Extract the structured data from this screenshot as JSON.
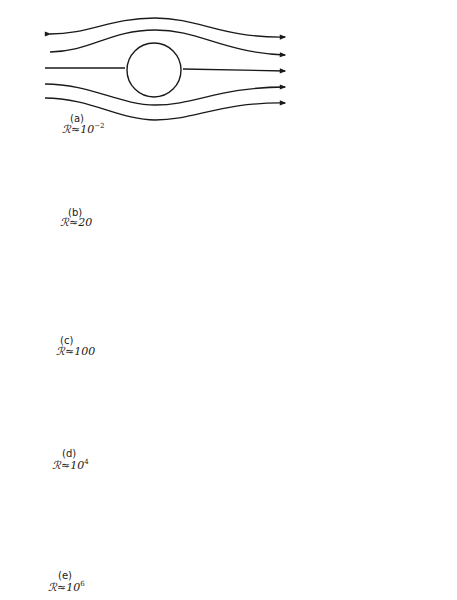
{
  "figure": {
    "panels": [
      {
        "id": "a",
        "tag": "(a)",
        "re_symbol": "ℛ",
        "approx": "≈",
        "re_base": "10",
        "re_exp": "−2",
        "regime": "creeping flow"
      },
      {
        "id": "b",
        "tag": "(b)",
        "re_symbol": "ℛ",
        "approx": "≈",
        "re_base": "20",
        "re_exp": "",
        "regime": "attached twin vortices"
      },
      {
        "id": "c",
        "tag": "(c)",
        "re_symbol": "ℛ",
        "approx": "≈",
        "re_base": "100",
        "re_exp": "",
        "regime": "vortex street"
      },
      {
        "id": "d",
        "tag": "(d)",
        "re_symbol": "ℛ",
        "approx": "≈",
        "re_base": "10",
        "re_exp": "4",
        "regime": "turbulent wake"
      },
      {
        "id": "e",
        "tag": "(e)",
        "re_symbol": "ℛ",
        "approx": "≈",
        "re_base": "10",
        "re_exp": "6",
        "regime": "turbulent boundary layer"
      }
    ]
  },
  "colors": {
    "ink": "#1a1a1a",
    "paper": "#ffffff"
  }
}
